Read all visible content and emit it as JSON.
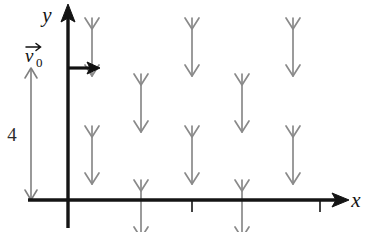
{
  "figure": {
    "background_color": "#ffffff",
    "width": 375,
    "height": 232
  },
  "axes": {
    "color": "#141414",
    "x_axis": {
      "label": "x",
      "label_x": 356,
      "label_y": 207,
      "start_x": 28,
      "end_x": 340,
      "y": 200,
      "stroke_width": 3.4,
      "arrowhead": "right",
      "ticks": [
        {
          "name": "x-tick-1",
          "x": 192,
          "y_top": 200,
          "y_bottom": 212
        },
        {
          "name": "x-tick-2",
          "x": 320,
          "y_top": 200,
          "y_bottom": 212
        }
      ]
    },
    "y_axis": {
      "label": "y",
      "label_x": 47,
      "label_y": 22,
      "x": 68,
      "start_y": 228,
      "end_y": 14,
      "stroke_width": 3.4,
      "arrowhead": "up"
    }
  },
  "velocity_vector": {
    "name": "initial-velocity-vector",
    "label": "v",
    "subscript": "0",
    "label_x": 25,
    "label_y": 62,
    "color": "#111111",
    "start_x": 68,
    "start_y": 68,
    "end_x": 96,
    "end_y": 68,
    "stroke_width": 3.2,
    "overset_arrow": true
  },
  "dimension": {
    "name": "height-dimension",
    "label": "4",
    "label_x": 12,
    "label_y": 141,
    "color": "#808080",
    "x": 31,
    "top_y": 68,
    "bottom_y": 200,
    "stroke_width": 1.6,
    "double_headed": true
  },
  "field": {
    "name": "downward-field-arrows",
    "color": "#8a8a8a",
    "stroke_width": 1.7,
    "arrow_length": 58,
    "head_half_width": 7,
    "head_height": 11,
    "description": "Uniform downward vector field drawn as staggered rows of gray arrows",
    "arrows": [
      {
        "row": 1,
        "col": 1,
        "x": 92,
        "top_y": 18,
        "bottom_y": 76
      },
      {
        "row": 1,
        "col": 2,
        "x": 192,
        "top_y": 18,
        "bottom_y": 76
      },
      {
        "row": 1,
        "col": 3,
        "x": 293,
        "top_y": 18,
        "bottom_y": 76
      },
      {
        "row": 2,
        "col": 1,
        "x": 141,
        "top_y": 74,
        "bottom_y": 132
      },
      {
        "row": 2,
        "col": 2,
        "x": 242,
        "top_y": 74,
        "bottom_y": 132
      },
      {
        "row": 3,
        "col": 1,
        "x": 92,
        "top_y": 126,
        "bottom_y": 184
      },
      {
        "row": 3,
        "col": 2,
        "x": 192,
        "top_y": 126,
        "bottom_y": 184
      },
      {
        "row": 3,
        "col": 3,
        "x": 293,
        "top_y": 126,
        "bottom_y": 184
      },
      {
        "row": 4,
        "col": 1,
        "x": 141,
        "top_y": 180,
        "bottom_y": 238
      },
      {
        "row": 4,
        "col": 2,
        "x": 242,
        "top_y": 180,
        "bottom_y": 238
      }
    ]
  }
}
